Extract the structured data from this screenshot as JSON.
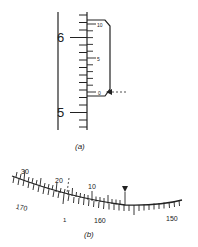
{
  "figure_a": {
    "caption": "(a)",
    "main_scale": {
      "labels": [
        "6",
        "5"
      ]
    },
    "vernier": {
      "labels": [
        "10",
        "5",
        "0"
      ]
    }
  },
  "figure_b": {
    "caption": "(b)",
    "upper_labels": [
      "30",
      "20",
      "10"
    ],
    "lower_labels": [
      "170",
      "160",
      "150"
    ],
    "index_mark": "1"
  },
  "colors": {
    "ink": "#222222",
    "background": "#ffffff"
  }
}
